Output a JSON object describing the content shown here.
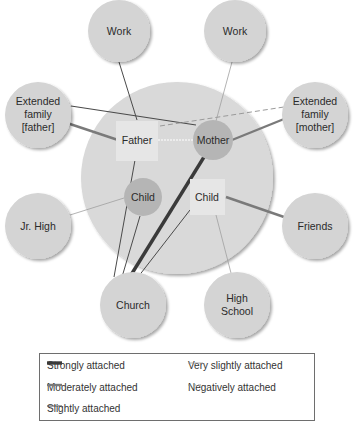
{
  "diagram": {
    "type": "ecomap",
    "household": {
      "members": [
        {
          "id": "father",
          "label": "Father",
          "shape": "box"
        },
        {
          "id": "mother",
          "label": "Mother",
          "shape": "circle"
        },
        {
          "id": "child_left",
          "label": "Child",
          "shape": "circle"
        },
        {
          "id": "child_right",
          "label": "Child",
          "shape": "box"
        }
      ]
    },
    "systems": [
      {
        "id": "work_left",
        "label": "Work"
      },
      {
        "id": "work_right",
        "label": "Work"
      },
      {
        "id": "ext_father",
        "label_lines": [
          "Extended",
          "family",
          "[father]"
        ]
      },
      {
        "id": "ext_mother",
        "label_lines": [
          "Extended",
          "family",
          "[mother]"
        ]
      },
      {
        "id": "jr_high",
        "label": "Jr. High"
      },
      {
        "id": "friends",
        "label": "Friends"
      },
      {
        "id": "church",
        "label": "Church"
      },
      {
        "id": "high_school",
        "label_lines": [
          "High",
          "School"
        ]
      }
    ],
    "connections": [
      {
        "from": "father",
        "to": "work_left",
        "type": "slightly"
      },
      {
        "from": "mother",
        "to": "work_right",
        "type": "very_slightly"
      },
      {
        "from": "father",
        "to": "ext_father",
        "type": "moderately"
      },
      {
        "from": "mother",
        "to": "ext_father",
        "type": "slightly"
      },
      {
        "from": "mother",
        "to": "ext_mother",
        "type": "moderately"
      },
      {
        "from": "father",
        "to": "ext_mother",
        "type": "negatively"
      },
      {
        "from": "father",
        "to": "mother",
        "type": "very_slightly"
      },
      {
        "from": "child_left",
        "to": "jr_high",
        "type": "very_slightly"
      },
      {
        "from": "child_right",
        "to": "friends",
        "type": "moderately"
      },
      {
        "from": "child_right",
        "to": "high_school",
        "type": "very_slightly"
      },
      {
        "from": "father",
        "to": "church",
        "type": "slightly"
      },
      {
        "from": "child_left",
        "to": "church",
        "type": "slightly"
      },
      {
        "from": "mother",
        "to": "church",
        "type": "strongly"
      },
      {
        "from": "child_right",
        "to": "church",
        "type": "slightly"
      }
    ]
  },
  "legend": {
    "items": [
      {
        "key": "strongly",
        "label": "Strongly attached"
      },
      {
        "key": "moderately",
        "label": "Moderately attached"
      },
      {
        "key": "slightly",
        "label": "Slightly attached"
      },
      {
        "key": "very_slightly",
        "label": "Very slightly attached"
      },
      {
        "key": "negatively",
        "label": "Negatively attached"
      }
    ]
  },
  "colors": {
    "system_fill": "#d4d4d4",
    "household_fill": "#d9d9d9",
    "member_circle_fill": "#b5b5b5",
    "member_box_fill": "#e6e6e6",
    "strong_line": "#3a3a3a",
    "moderate_line": "#7a7a7a",
    "slight_line": "#4a4a4a",
    "very_slight_line": "#a0a0a0",
    "negative_line": "#9a9a9a"
  }
}
